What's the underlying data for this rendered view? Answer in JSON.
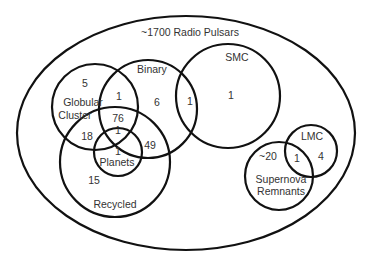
{
  "diagram": {
    "type": "venn",
    "universe": {
      "label": "~1700 Radio Pulsars"
    },
    "sets": [
      {
        "id": "globular",
        "label_line1": "Globular",
        "label_line2": "Cluster"
      },
      {
        "id": "binary",
        "label": "Binary"
      },
      {
        "id": "smc",
        "label": "SMC"
      },
      {
        "id": "recycled",
        "label": "Recycled"
      },
      {
        "id": "planets",
        "label": "Planets"
      },
      {
        "id": "lmc",
        "label": "LMC"
      },
      {
        "id": "snr",
        "label_line1": "Supernova",
        "label_line2": "Remnants"
      }
    ],
    "regions": {
      "globular_only": "5",
      "globular_binary": "1",
      "binary_only": "6",
      "binary_smc": "1",
      "smc_only": "1",
      "globular_binary_recycled": "76",
      "globular_recycled": "18",
      "globular_binary_recycled_planets": "1",
      "binary_recycled": "49",
      "recycled_planets": "1",
      "recycled_only": "15",
      "snr_only": "~20",
      "snr_lmc": "1",
      "lmc_only": "4"
    }
  }
}
